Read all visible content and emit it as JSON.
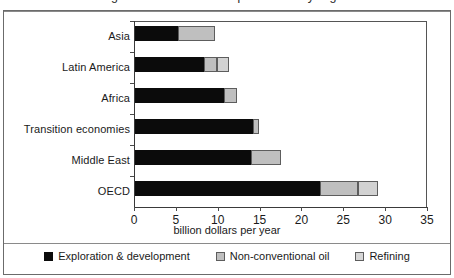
{
  "figure": {
    "clipped_title": "Figure 1: Investment requirements by region"
  },
  "chart_data": {
    "type": "bar",
    "orientation": "horizontal",
    "stacked": true,
    "title": "",
    "xlabel": "billion dollars per year",
    "ylabel": "",
    "xlim": [
      0,
      35
    ],
    "xticks": [
      0,
      5,
      10,
      15,
      20,
      25,
      30,
      35
    ],
    "xtick_labels": [
      "0",
      "5",
      "10",
      "15",
      "20",
      "25",
      "30",
      "35"
    ],
    "grid": false,
    "legend_position": "bottom",
    "categories": [
      "Asia",
      "Latin America",
      "Africa",
      "Transition economies",
      "Middle East",
      "OECD"
    ],
    "series": [
      {
        "name": "Exploration & development",
        "color": "#0b0b0b",
        "values": [
          5.1,
          8.3,
          10.6,
          14.1,
          13.9,
          22.1
        ]
      },
      {
        "name": "Non-conventional oil",
        "color": "#bfbfbf",
        "values": [
          4.5,
          1.5,
          1.6,
          0.7,
          3.5,
          4.5
        ]
      },
      {
        "name": "Refining",
        "color": "#d6d6d6",
        "values": [
          0,
          1.4,
          0,
          0,
          0,
          2.4
        ]
      }
    ],
    "totals": [
      9.6,
      11.2,
      12.2,
      14.8,
      17.4,
      29.0
    ]
  },
  "legend": {
    "items": [
      {
        "label": "Exploration & development"
      },
      {
        "label": "Non-conventional oil"
      },
      {
        "label": "Refining"
      }
    ]
  }
}
